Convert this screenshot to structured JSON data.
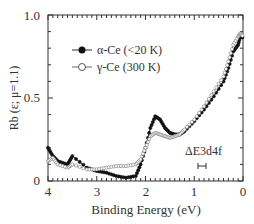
{
  "chart_data": {
    "type": "line",
    "title": "",
    "xlabel": "Binding Energy (eV)",
    "ylabel": "Rb (ε; μ=1.1)",
    "xlim": [
      4,
      0
    ],
    "ylim": [
      0,
      1.0
    ],
    "xticks": [
      "4",
      "3",
      "2",
      "1",
      "0"
    ],
    "yticks": [
      "0",
      "0.5",
      "1.0"
    ],
    "annotation": "ΔE3d4f",
    "legend": [
      "α-Ce (<20 K)",
      "γ-Ce (300 K)"
    ],
    "series": [
      {
        "name": "α-Ce (<20 K)",
        "marker": "filled-circle",
        "x": [
          4.0,
          3.9,
          3.8,
          3.6,
          3.5,
          3.2,
          3.0,
          2.8,
          2.6,
          2.4,
          2.2,
          2.1,
          2.0,
          1.9,
          1.8,
          1.7,
          1.6,
          1.5,
          1.4,
          1.3,
          1.2,
          1.0,
          0.8,
          0.6,
          0.4,
          0.3,
          0.2,
          0.1,
          0.05,
          0.0
        ],
        "y": [
          0.2,
          0.15,
          0.12,
          0.1,
          0.15,
          0.08,
          0.06,
          0.05,
          0.03,
          0.02,
          0.03,
          0.1,
          0.2,
          0.32,
          0.39,
          0.37,
          0.32,
          0.29,
          0.28,
          0.28,
          0.3,
          0.36,
          0.43,
          0.51,
          0.6,
          0.68,
          0.78,
          0.82,
          0.88,
          0.86
        ]
      },
      {
        "name": "γ-Ce (300 K)",
        "marker": "open-circle",
        "x": [
          4.0,
          3.9,
          3.8,
          3.6,
          3.5,
          3.2,
          3.0,
          2.8,
          2.6,
          2.4,
          2.2,
          2.1,
          2.0,
          1.9,
          1.8,
          1.7,
          1.6,
          1.5,
          1.4,
          1.3,
          1.2,
          1.0,
          0.8,
          0.6,
          0.4,
          0.3,
          0.2,
          0.1,
          0.05,
          0.0
        ],
        "y": [
          0.12,
          0.14,
          0.1,
          0.08,
          0.1,
          0.07,
          0.07,
          0.08,
          0.09,
          0.09,
          0.1,
          0.13,
          0.2,
          0.27,
          0.29,
          0.28,
          0.27,
          0.26,
          0.27,
          0.28,
          0.31,
          0.37,
          0.45,
          0.54,
          0.63,
          0.72,
          0.82,
          0.87,
          0.89,
          0.87
        ]
      }
    ]
  }
}
